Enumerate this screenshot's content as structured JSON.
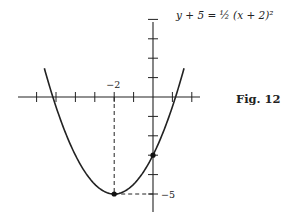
{
  "figure": {
    "equation": "y + 5 = ½ (x + 2)²",
    "caption": "Fig. 12",
    "x_tick_label": "−2",
    "y_tick_label": "−5"
  },
  "graph": {
    "origin_px": [
      153,
      97
    ],
    "unit_px": 19.4,
    "x_ticks": [
      -6,
      -5,
      -4,
      -3,
      -2,
      -1,
      1,
      2
    ],
    "y_ticks": [
      4,
      3,
      2,
      1,
      -1,
      -2,
      -3,
      -4,
      -5
    ],
    "vertex": [
      -2,
      -5
    ],
    "y_intercept": [
      0,
      -3
    ],
    "curve": "y = 0.5*(x+2)^2 - 5",
    "x_range": [
      -5.6,
      1.6
    ],
    "line_color": "#222222"
  }
}
